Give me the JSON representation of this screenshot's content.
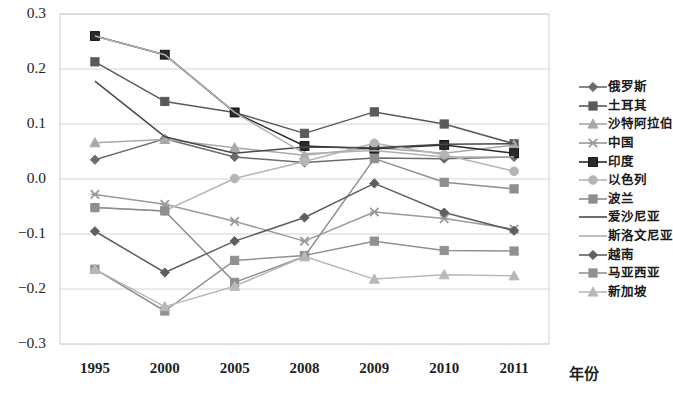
{
  "chart_data": {
    "type": "line",
    "title": "",
    "xlabel": "年份",
    "ylabel": "",
    "categories": [
      "1995",
      "2000",
      "2005",
      "2008",
      "2009",
      "2010",
      "2011"
    ],
    "ylim": [
      -0.3,
      0.3
    ],
    "ytick_labels": [
      "0.3",
      "0.2",
      "0.1",
      "0.0",
      "-0.1",
      "-0.2",
      "-0.3"
    ],
    "ytick_values": [
      0.3,
      0.2,
      0.1,
      0.0,
      -0.1,
      -0.2,
      -0.3
    ],
    "grid": true,
    "legend_position": "right",
    "series": [
      {
        "name": "俄罗斯",
        "marker": "diamond",
        "color": "#6b6b6b",
        "values": [
          0.035,
          0.073,
          0.04,
          0.03,
          0.038,
          0.037,
          0.04
        ]
      },
      {
        "name": "土耳其",
        "marker": "square",
        "color": "#5a5a5a",
        "values": [
          0.213,
          0.141,
          0.121,
          0.083,
          0.122,
          0.1,
          0.064
        ]
      },
      {
        "name": "沙特阿拉伯",
        "marker": "triangle",
        "color": "#a8a8a8",
        "values": [
          0.066,
          0.072,
          0.057,
          0.043,
          0.057,
          0.047,
          0.062
        ]
      },
      {
        "name": "中国",
        "marker": "x",
        "color": "#9a9a9a",
        "values": [
          -0.028,
          -0.046,
          -0.077,
          -0.113,
          -0.06,
          -0.072,
          -0.091
        ]
      },
      {
        "name": "印度",
        "marker": "filled-square",
        "color": "#2b2b2b",
        "values": [
          0.26,
          0.226,
          0.121,
          0.06,
          0.055,
          0.062,
          0.047
        ]
      },
      {
        "name": "以色列",
        "marker": "circle",
        "color": "#b5b5b5",
        "values": [
          -0.052,
          -0.058,
          0.001,
          0.032,
          0.065,
          0.044,
          0.014
        ]
      },
      {
        "name": "波兰",
        "marker": "square",
        "color": "#8e8e8e",
        "values": [
          -0.052,
          -0.058,
          -0.188,
          -0.141,
          0.037,
          -0.006,
          -0.018
        ]
      },
      {
        "name": "爱沙尼亚",
        "marker": "none",
        "color": "#4a4a4a",
        "values": [
          0.178,
          0.077,
          0.047,
          0.058,
          0.057,
          0.063,
          0.064
        ]
      },
      {
        "name": "斯洛文尼亚",
        "marker": "none",
        "color": "#b0b0b0",
        "values": [
          0.26,
          0.226,
          0.121,
          0.046,
          0.052,
          0.04,
          0.04
        ]
      },
      {
        "name": "越南",
        "marker": "diamond",
        "color": "#5f5f5f",
        "values": [
          -0.095,
          -0.17,
          -0.113,
          -0.07,
          -0.008,
          -0.061,
          -0.094
        ]
      },
      {
        "name": "马亚西亚",
        "marker": "square",
        "color": "#919191",
        "values": [
          -0.164,
          -0.24,
          -0.148,
          -0.139,
          -0.113,
          -0.13,
          -0.131
        ]
      },
      {
        "name": "新加坡",
        "marker": "triangle",
        "color": "#b8b8b8",
        "values": [
          -0.164,
          -0.232,
          -0.195,
          -0.141,
          -0.182,
          -0.174,
          -0.176
        ]
      }
    ]
  },
  "axis": {
    "x_title": "年份"
  }
}
